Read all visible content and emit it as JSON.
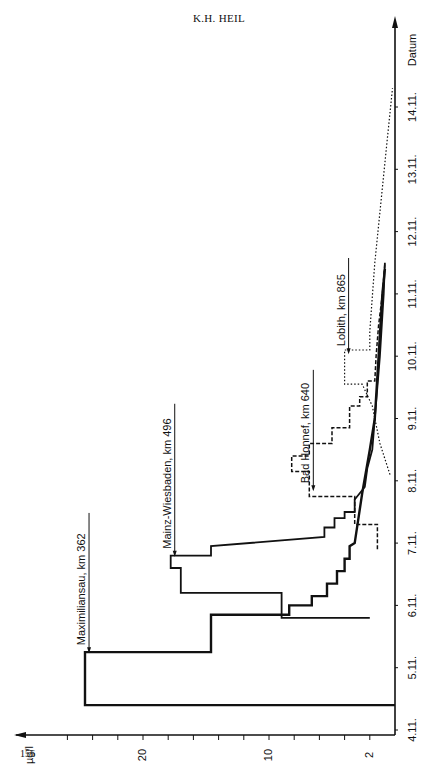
{
  "page": {
    "header": "K.H. HEIL",
    "page_number": "156"
  },
  "chart_data": {
    "type": "line",
    "orientation": "rotated-90",
    "title": "",
    "xlabel": "Datum",
    "ylabel": "µg/l",
    "x_ticks": [
      "4.11.",
      "5.11.",
      "6.11.",
      "7.11.",
      "8.11.",
      "9.11.",
      "10.11.",
      "11.11.",
      "12.11.",
      "13.11.",
      "14.11."
    ],
    "y_ticks": [
      2,
      10,
      20
    ],
    "ylim": [
      0,
      26
    ],
    "xlim": [
      4.0,
      14.5
    ],
    "grid": false,
    "legend_position": "inline-annotations",
    "series": [
      {
        "name": "Maximiliansau, km 362",
        "style": "solid-thick",
        "points": [
          [
            4.4,
            0
          ],
          [
            4.4,
            24.6
          ],
          [
            5.25,
            24.6
          ],
          [
            5.25,
            14.6
          ],
          [
            5.85,
            14.6
          ],
          [
            5.85,
            8.4
          ],
          [
            6.0,
            8.4
          ],
          [
            6.0,
            6.6
          ],
          [
            6.15,
            6.6
          ],
          [
            6.15,
            5.4
          ],
          [
            6.35,
            5.4
          ],
          [
            6.35,
            4.6
          ],
          [
            6.55,
            4.6
          ],
          [
            6.55,
            4.0
          ],
          [
            6.75,
            4.0
          ],
          [
            6.75,
            3.6
          ],
          [
            6.95,
            3.6
          ],
          [
            7.0,
            3.2
          ],
          [
            7.8,
            2.6
          ],
          [
            8.5,
            2.0
          ],
          [
            9.0,
            1.6
          ],
          [
            10.0,
            1.3
          ],
          [
            11.0,
            1.0
          ],
          [
            11.4,
            0.8
          ]
        ]
      },
      {
        "name": "Mainz-Wiesbaden, km 496",
        "style": "solid",
        "points": [
          [
            5.8,
            2.0
          ],
          [
            5.8,
            9.0
          ],
          [
            6.2,
            9.0
          ],
          [
            6.2,
            17.0
          ],
          [
            6.6,
            17.0
          ],
          [
            6.6,
            17.8
          ],
          [
            6.8,
            17.8
          ],
          [
            6.8,
            14.6
          ],
          [
            6.95,
            14.6
          ],
          [
            7.1,
            5.6
          ],
          [
            7.25,
            5.6
          ],
          [
            7.25,
            4.8
          ],
          [
            7.4,
            4.8
          ],
          [
            7.4,
            4.0
          ],
          [
            7.5,
            4.0
          ],
          [
            7.5,
            3.2
          ],
          [
            7.7,
            3.2
          ],
          [
            7.9,
            2.4
          ],
          [
            8.2,
            2.2
          ],
          [
            8.5,
            1.8
          ],
          [
            9.0,
            1.6
          ],
          [
            10.0,
            1.2
          ],
          [
            11.0,
            0.9
          ],
          [
            11.5,
            0.8
          ]
        ]
      },
      {
        "name": "Bad Honnef, km 640",
        "style": "dashed",
        "points": [
          [
            6.9,
            1.4
          ],
          [
            7.3,
            1.4
          ],
          [
            7.3,
            3.2
          ],
          [
            7.75,
            3.2
          ],
          [
            7.75,
            6.8
          ],
          [
            8.15,
            6.8
          ],
          [
            8.15,
            8.2
          ],
          [
            8.4,
            8.2
          ],
          [
            8.4,
            6.8
          ],
          [
            8.6,
            6.8
          ],
          [
            8.6,
            5.0
          ],
          [
            8.85,
            5.0
          ],
          [
            8.85,
            3.6
          ],
          [
            9.2,
            3.6
          ],
          [
            9.2,
            2.8
          ],
          [
            9.35,
            2.8
          ],
          [
            9.35,
            2.2
          ],
          [
            9.6,
            2.2
          ],
          [
            9.6,
            1.6
          ],
          [
            10.0,
            1.5
          ],
          [
            10.5,
            1.3
          ],
          [
            11.0,
            1.0
          ],
          [
            11.5,
            0.8
          ]
        ]
      },
      {
        "name": "Lobith, km 865",
        "style": "dotted",
        "points": [
          [
            8.1,
            0.4
          ],
          [
            8.6,
            1.2
          ],
          [
            9.2,
            1.8
          ],
          [
            9.55,
            2.6
          ],
          [
            9.55,
            4.0
          ],
          [
            10.1,
            4.0
          ],
          [
            10.1,
            2.0
          ],
          [
            10.4,
            2.0
          ],
          [
            11.5,
            1.6
          ],
          [
            12.5,
            1.1
          ],
          [
            13.5,
            0.6
          ],
          [
            14.3,
            0.2
          ]
        ]
      }
    ]
  },
  "annotations": [
    {
      "label": "Maximiliansau, km 362",
      "x_day": 5.2,
      "y_val": 24.6
    },
    {
      "label": "Mainz-Wiesbaden, km 496",
      "x_day": 6.75,
      "y_val": 17.8
    },
    {
      "label": "Bad Honnef, km 640",
      "x_day": 7.8,
      "y_val": 6.8
    },
    {
      "label": "Lobith, km 865",
      "x_day": 10.0,
      "y_val": 4.0
    }
  ]
}
